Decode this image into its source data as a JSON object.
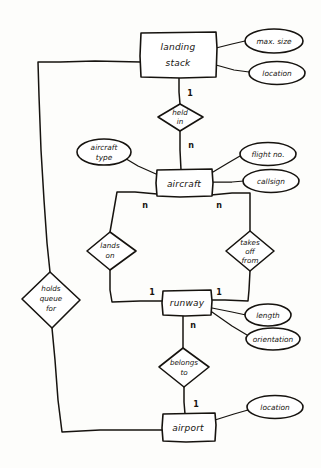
{
  "diagram": {
    "style": "hand-drawn entity relationship diagram",
    "ink_color": "#16130f",
    "background_color": "#fdfdfb",
    "entities": [
      {
        "id": "landing-stack",
        "label": "landing stack"
      },
      {
        "id": "aircraft",
        "label": "aircraft"
      },
      {
        "id": "runway",
        "label": "runway"
      },
      {
        "id": "airport",
        "label": "airport"
      }
    ],
    "relationships": [
      {
        "id": "held-in",
        "label_line1": "held",
        "label_line2": "in"
      },
      {
        "id": "lands-on",
        "label_line1": "lands",
        "label_line2": "on"
      },
      {
        "id": "takes-off-from",
        "label_line1": "takes",
        "label_line2": "off",
        "label_line3": "from"
      },
      {
        "id": "holds-queue-for",
        "label_line1": "holds",
        "label_line2": "queue",
        "label_line3": "for"
      },
      {
        "id": "belongs-to",
        "label_line1": "belongs",
        "label_line2": "to"
      }
    ],
    "attributes": [
      {
        "id": "max-size",
        "label": "max. size",
        "owner": "landing-stack"
      },
      {
        "id": "location-stack",
        "label": "location",
        "owner": "landing-stack"
      },
      {
        "id": "aircraft-type",
        "label_line1": "aircraft",
        "label_line2": "type",
        "owner": "aircraft"
      },
      {
        "id": "flight-no",
        "label": "flight no.",
        "owner": "aircraft"
      },
      {
        "id": "callsign",
        "label": "callsign",
        "owner": "aircraft"
      },
      {
        "id": "length",
        "label": "length",
        "owner": "runway"
      },
      {
        "id": "orientation",
        "label": "orientation",
        "owner": "runway"
      },
      {
        "id": "location-airport",
        "label": "location",
        "owner": "airport"
      }
    ],
    "cardinalities": [
      {
        "id": "card-stack-heldin",
        "label": "1"
      },
      {
        "id": "card-heldin-aircraft",
        "label": "n"
      },
      {
        "id": "card-aircraft-landson",
        "label": "n"
      },
      {
        "id": "card-aircraft-takesoff",
        "label": "n"
      },
      {
        "id": "card-landson-runway",
        "label": "1"
      },
      {
        "id": "card-takesoff-runway",
        "label": "1"
      },
      {
        "id": "card-runway-belongsto",
        "label": "n"
      },
      {
        "id": "card-belongsto-airport",
        "label": "1"
      }
    ]
  }
}
